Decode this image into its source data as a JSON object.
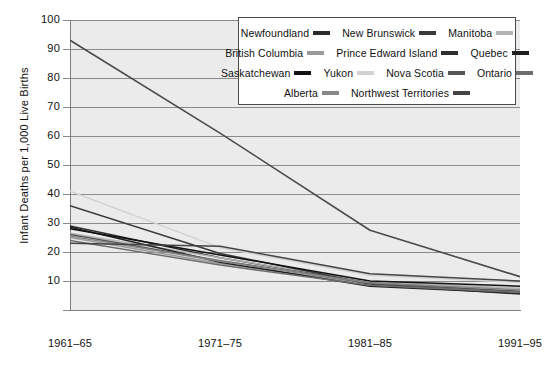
{
  "chart_data": {
    "type": "line",
    "title": "",
    "xlabel": "",
    "ylabel": "Infant Deaths per 1,000 Live Births",
    "categories": [
      "1961–65",
      "1971–75",
      "1981–85",
      "1991–95"
    ],
    "yticks": [
      100,
      90,
      80,
      70,
      60,
      50,
      40,
      30,
      20,
      10
    ],
    "ylim": [
      0,
      100
    ],
    "grid": true,
    "legend_position": "top-right-inside",
    "series": [
      {
        "name": "Newfoundland",
        "color": "#4a4a4a",
        "width": 1.6,
        "values": [
          93.0,
          61.0,
          27.5,
          11.5
        ]
      },
      {
        "name": "New Brunswick",
        "color": "#2b2b2b",
        "width": 1.5,
        "values": [
          29.0,
          18.0,
          9.5,
          6.0
        ]
      },
      {
        "name": "Manitoba",
        "color": "#b4b4b4",
        "width": 1.5,
        "values": [
          26.5,
          18.0,
          9.8,
          7.5
        ]
      },
      {
        "name": "British Columbia",
        "color": "#9a9a9a",
        "width": 1.5,
        "values": [
          25.0,
          16.0,
          9.0,
          6.2
        ]
      },
      {
        "name": "Prince Edward Island",
        "color": "#3a3a3a",
        "width": 1.5,
        "values": [
          36.0,
          19.5,
          9.0,
          5.5
        ]
      },
      {
        "name": "Quebec",
        "color": "#1f1f1f",
        "width": 1.5,
        "values": [
          28.5,
          16.5,
          8.2,
          5.8
        ]
      },
      {
        "name": "Saskatchewan",
        "color": "#111111",
        "width": 1.5,
        "values": [
          28.0,
          19.0,
          10.0,
          8.2
        ]
      },
      {
        "name": "Yukon",
        "color": "#d2d2d2",
        "width": 1.5,
        "values": [
          41.0,
          21.5,
          12.0,
          9.5
        ]
      },
      {
        "name": "Nova Scotia",
        "color": "#555555",
        "width": 1.5,
        "values": [
          26.0,
          17.0,
          9.2,
          6.5
        ]
      },
      {
        "name": "Ontario",
        "color": "#6e6e6e",
        "width": 1.5,
        "values": [
          24.0,
          15.5,
          8.5,
          6.0
        ]
      },
      {
        "name": "Alberta",
        "color": "#878787",
        "width": 1.5,
        "values": [
          25.5,
          16.8,
          9.4,
          7.0
        ]
      },
      {
        "name": "Northwest Territories",
        "color": "#444444",
        "width": 1.5,
        "values": [
          23.0,
          22.0,
          12.5,
          10.0
        ]
      }
    ]
  },
  "legend": {
    "rows": [
      [
        {
          "label": "Newfoundland",
          "color": "#2b2b2b"
        },
        {
          "label": "New Brunswick",
          "color": "#3a3a3a"
        },
        {
          "label": "Manitoba",
          "color": "#b4b4b4"
        }
      ],
      [
        {
          "label": "British Columbia",
          "color": "#9a9a9a"
        },
        {
          "label": "Prince Edward Island",
          "color": "#2f2f2f"
        },
        {
          "label": "Quebec",
          "color": "#1f1f1f"
        }
      ],
      [
        {
          "label": "Saskatchewan",
          "color": "#111111"
        },
        {
          "label": "Yukon",
          "color": "#d2d2d2"
        },
        {
          "label": "Nova Scotia",
          "color": "#555555"
        },
        {
          "label": "Ontario",
          "color": "#6e6e6e"
        }
      ],
      [
        {
          "label": "Alberta",
          "color": "#878787"
        },
        {
          "label": "Northwest Territories",
          "color": "#444444"
        }
      ]
    ]
  },
  "colors": {
    "plot_background": "#ebebeb",
    "gridline": "#8a8a8a",
    "axis": "#7d7d7d",
    "text": "#111111",
    "page_background": "#ffffff"
  }
}
